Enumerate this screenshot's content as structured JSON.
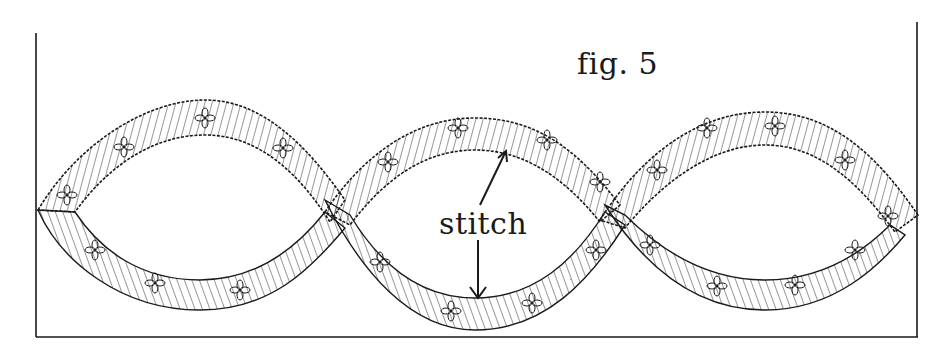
{
  "figure": {
    "caption": "fig. 5",
    "callout_label": "stitch",
    "colors": {
      "ink": "#1a1a1a",
      "paper": "#ffffff"
    },
    "loops_count": 3,
    "arrows": [
      {
        "name": "upper-arrow",
        "direction": "up",
        "from": [
          480,
          205
        ],
        "to": [
          505,
          152
        ]
      },
      {
        "name": "lower-arrow",
        "direction": "down",
        "from": [
          478,
          240
        ],
        "to": [
          478,
          297
        ]
      }
    ]
  }
}
